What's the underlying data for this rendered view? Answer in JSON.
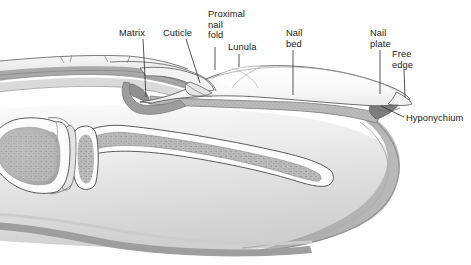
{
  "figure": {
    "width": 471,
    "height": 265,
    "background": "#ffffff"
  },
  "labels": [
    {
      "id": "matrix",
      "name": "label-matrix",
      "lines": [
        "Matrix"
      ],
      "x": 119,
      "y": 36,
      "anchor": "start",
      "leader": [
        [
          143,
          39
        ],
        [
          146,
          97
        ]
      ]
    },
    {
      "id": "cuticle",
      "name": "label-cuticle",
      "lines": [
        "Cuticle"
      ],
      "x": 163,
      "y": 36,
      "anchor": "start",
      "leader": [
        [
          186,
          39
        ],
        [
          200,
          83
        ]
      ]
    },
    {
      "id": "proximal-nail-fold",
      "name": "label-proximal-nail-fold",
      "lines": [
        "Proximal",
        "nail",
        "fold"
      ],
      "x": 208,
      "y": 17,
      "anchor": "start",
      "leader": [
        [
          215,
          47
        ],
        [
          215,
          70
        ]
      ]
    },
    {
      "id": "lunula",
      "name": "label-lunula",
      "lines": [
        "Lunula"
      ],
      "x": 228,
      "y": 50,
      "anchor": "start",
      "leader": [
        [
          239,
          54
        ],
        [
          239,
          67
        ]
      ]
    },
    {
      "id": "nail-bed",
      "name": "label-nail-bed",
      "lines": [
        "Nail",
        "bed"
      ],
      "x": 286,
      "y": 36,
      "anchor": "start",
      "leader": [
        [
          293,
          50
        ],
        [
          293,
          95
        ]
      ]
    },
    {
      "id": "nail-plate",
      "name": "label-nail-plate",
      "lines": [
        "Nail",
        "plate"
      ],
      "x": 370,
      "y": 36,
      "anchor": "start",
      "leader": [
        [
          380,
          50
        ],
        [
          380,
          94
        ]
      ]
    },
    {
      "id": "free-edge",
      "name": "label-free-edge",
      "lines": [
        "Free",
        "edge"
      ],
      "x": 392,
      "y": 57,
      "anchor": "start",
      "leader": [
        [
          404,
          70
        ],
        [
          405,
          97
        ]
      ]
    },
    {
      "id": "hyponychium",
      "name": "label-hyponychium",
      "lines": [
        "Hyponychium"
      ],
      "x": 406,
      "y": 121,
      "anchor": "start",
      "leader": [
        [
          404,
          117
        ],
        [
          381,
          106
        ]
      ]
    }
  ],
  "colors": {
    "line": "#2b2b2b",
    "nail_plate": "#fbfbfb",
    "nail_bed": "#b6b6b6",
    "matrix": "#9a9a9a",
    "dermis": "#a8a8a8",
    "bone_cortical": "#fdfdfd",
    "bone_cancellous": "#b2b2b2",
    "soft_tissue": "#efefef",
    "skin_band": "#9d9d9d",
    "background": "#ffffff",
    "text": "#1a1a1a"
  },
  "structures": [
    {
      "id": "distal-phalanx",
      "name": "distal-phalanx-bone"
    },
    {
      "id": "middle-phalanx-head",
      "name": "middle-phalanx-head-bone"
    },
    {
      "id": "joint-space",
      "name": "interphalangeal-joint"
    },
    {
      "id": "pulp",
      "name": "fingertip-pulp-soft-tissue"
    },
    {
      "id": "nail-plate-shape",
      "name": "nail-plate"
    },
    {
      "id": "nail-bed-shape",
      "name": "nail-bed"
    },
    {
      "id": "matrix-shape",
      "name": "nail-matrix"
    },
    {
      "id": "proximal-fold-shape",
      "name": "proximal-nail-fold"
    },
    {
      "id": "cuticle-shape",
      "name": "cuticle-eponychium"
    },
    {
      "id": "lunula-shape",
      "name": "lunula"
    },
    {
      "id": "hyponychium-shape",
      "name": "hyponychium"
    },
    {
      "id": "free-edge-shape",
      "name": "free-edge"
    },
    {
      "id": "dorsal-skin",
      "name": "dorsal-skin-layers"
    },
    {
      "id": "volar-skin",
      "name": "volar-skin-line"
    }
  ]
}
